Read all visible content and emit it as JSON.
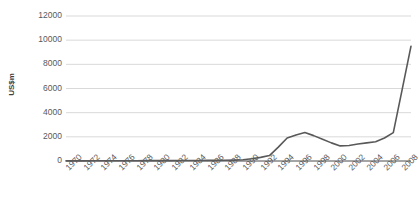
{
  "chart_data": {
    "type": "line",
    "title": "",
    "subtitle": "",
    "xlabel": "",
    "ylabel": "US$m",
    "ylim": [
      0,
      12000
    ],
    "xlim": [
      1970,
      2009
    ],
    "grid": true,
    "legend": false,
    "legend_position": "none",
    "line_color": "#595959",
    "gridline_color": "#d9d9d9",
    "tick_label_color": "#595959",
    "axis_title_color": "#404040",
    "background": "#ffffff",
    "ytick_labels": [
      "0",
      "2000",
      "4000",
      "6000",
      "8000",
      "10000",
      "12000"
    ],
    "ytick_values": [
      0,
      2000,
      4000,
      6000,
      8000,
      10000,
      12000
    ],
    "xtick_labels": [
      "1970",
      "1972",
      "1974",
      "1976",
      "1978",
      "1980",
      "1982",
      "1984",
      "1986",
      "1988",
      "1990",
      "1992",
      "1994",
      "1996",
      "1998",
      "2000",
      "2002",
      "2004",
      "2006",
      "2008"
    ],
    "xtick_values": [
      1970,
      1972,
      1974,
      1976,
      1978,
      1980,
      1982,
      1984,
      1986,
      1988,
      1990,
      1992,
      1994,
      1996,
      1998,
      2000,
      2002,
      2004,
      2006,
      2008
    ],
    "x": [
      1970,
      1971,
      1972,
      1973,
      1974,
      1975,
      1976,
      1977,
      1978,
      1979,
      1980,
      1981,
      1982,
      1983,
      1984,
      1985,
      1986,
      1987,
      1988,
      1989,
      1990,
      1991,
      1992,
      1993,
      1994,
      1995,
      1996,
      1997,
      1998,
      1999,
      2000,
      2001,
      2002,
      2003,
      2004,
      2005,
      2006,
      2007,
      2008,
      2009
    ],
    "values": [
      10,
      12,
      14,
      16,
      18,
      20,
      22,
      24,
      26,
      28,
      30,
      32,
      35,
      38,
      42,
      46,
      50,
      55,
      62,
      75,
      100,
      180,
      300,
      450,
      1150,
      1900,
      2150,
      2350,
      2100,
      1800,
      1500,
      1250,
      1280,
      1400,
      1500,
      1600,
      1900,
      2350,
      5900,
      9500
    ],
    "series": [
      {
        "name": "US$m",
        "color": "#595959",
        "values": [
          10,
          12,
          14,
          16,
          18,
          20,
          22,
          24,
          26,
          28,
          30,
          32,
          35,
          38,
          42,
          46,
          50,
          55,
          62,
          75,
          100,
          180,
          300,
          450,
          1150,
          1900,
          2150,
          2350,
          2100,
          1800,
          1500,
          1250,
          1280,
          1400,
          1500,
          1600,
          1900,
          2350,
          5900,
          9500
        ]
      }
    ]
  },
  "axis": {
    "y_title": "US$m"
  }
}
